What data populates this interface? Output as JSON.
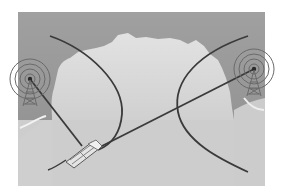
{
  "figure": {
    "colors": {
      "page_bg": "#ffffff",
      "frame_light": "#d6d6d6",
      "frame_light_bottom": "#c4c4c4",
      "frame_dark": "#9a9a9a",
      "line": "#3a3a3a",
      "tower": "#6a6a6a"
    },
    "elements": {
      "left_tower": {
        "label": "",
        "cx": 30,
        "cy": 79
      },
      "right_tower": {
        "label": "",
        "cx": 254,
        "cy": 69
      },
      "vehicle": {
        "label": "",
        "cx": 82,
        "cy": 152
      }
    }
  }
}
